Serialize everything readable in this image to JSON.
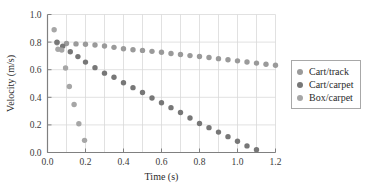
{
  "chart_data": {
    "type": "scatter",
    "title": "",
    "xlabel": "Time (s)",
    "ylabel": "Velocity (m/s)",
    "xlim": [
      0.0,
      1.2
    ],
    "ylim": [
      0.0,
      1.0
    ],
    "xticks": [
      "0.0",
      "0.2",
      "0.4",
      "0.6",
      "0.8",
      "1.0",
      "1.2"
    ],
    "xtick_values": [
      0.0,
      0.2,
      0.4,
      0.6,
      0.8,
      1.0,
      1.2
    ],
    "yticks": [
      "0.0",
      "0.2",
      "0.4",
      "0.6",
      "0.8",
      "1.0"
    ],
    "ytick_values": [
      0.0,
      0.2,
      0.4,
      0.6,
      0.8,
      1.0
    ],
    "grid": true,
    "grid_x_step": 0.1,
    "grid_y_step": 0.2,
    "legend_position": "right",
    "marker": "circle",
    "series": [
      {
        "name": "Cart/track",
        "color": "#9a9a9a",
        "x": [
          0.05,
          0.1,
          0.15,
          0.2,
          0.25,
          0.3,
          0.35,
          0.4,
          0.45,
          0.5,
          0.55,
          0.6,
          0.65,
          0.7,
          0.75,
          0.8,
          0.85,
          0.9,
          0.95,
          1.0,
          1.05,
          1.1,
          1.15,
          1.2
        ],
        "y": [
          0.795,
          0.79,
          0.787,
          0.784,
          0.779,
          0.772,
          0.762,
          0.752,
          0.745,
          0.74,
          0.733,
          0.726,
          0.717,
          0.71,
          0.702,
          0.696,
          0.688,
          0.68,
          0.672,
          0.664,
          0.656,
          0.648,
          0.64,
          0.632
        ]
      },
      {
        "name": "Cart/carpet",
        "color": "#777777",
        "x": [
          0.05,
          0.08,
          0.12,
          0.16,
          0.2,
          0.25,
          0.3,
          0.35,
          0.4,
          0.45,
          0.5,
          0.55,
          0.6,
          0.65,
          0.7,
          0.75,
          0.8,
          0.85,
          0.9,
          0.95,
          1.0,
          1.05,
          1.1
        ],
        "y": [
          0.8,
          0.77,
          0.73,
          0.695,
          0.655,
          0.615,
          0.575,
          0.545,
          0.505,
          0.47,
          0.435,
          0.395,
          0.36,
          0.325,
          0.29,
          0.25,
          0.21,
          0.18,
          0.148,
          0.115,
          0.082,
          0.048,
          0.02
        ]
      },
      {
        "name": "Box/carpet",
        "color": "#a6a6a6",
        "x": [
          0.035,
          0.055,
          0.075,
          0.095,
          0.115,
          0.14,
          0.165,
          0.195
        ],
        "y": [
          0.89,
          0.748,
          0.742,
          0.612,
          0.478,
          0.348,
          0.208,
          0.088
        ]
      }
    ]
  },
  "legend": {
    "items": [
      {
        "label": "Cart/track"
      },
      {
        "label": "Cart/carpet"
      },
      {
        "label": "Box/carpet"
      }
    ]
  },
  "colors": {
    "axis": "#808080",
    "grid": "#d9d9d9",
    "text": "#2b2b2b",
    "legend_border": "#a8a8a8"
  }
}
